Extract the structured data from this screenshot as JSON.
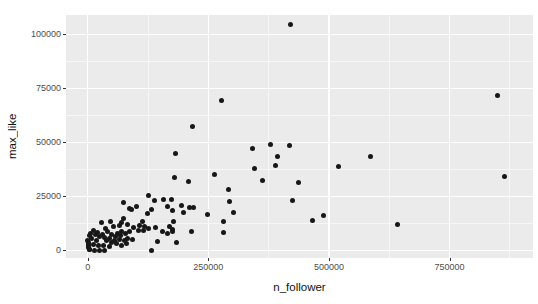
{
  "chart_data": {
    "type": "scatter",
    "title": "",
    "xlabel": "n_follower",
    "ylabel": "max_like",
    "legend": "none",
    "grid": true,
    "panel_bg": "#EBEBEB",
    "grid_major_color": "#FFFFFF",
    "grid_minor_color": "rgba(255,255,255,0.55)",
    "point_color": "#171717",
    "tick_color": "#333333",
    "tick_label_color": "#4D4D4D",
    "axis_title_color": "#111111",
    "xlim": [
      -45000,
      923000
    ],
    "ylim": [
      -3500,
      109000
    ],
    "x_ticks": [
      {
        "label": "0",
        "value": 0
      },
      {
        "label": "250000",
        "value": 250000
      },
      {
        "label": "500000",
        "value": 500000
      },
      {
        "label": "750000",
        "value": 750000
      }
    ],
    "y_ticks": [
      {
        "label": "0",
        "value": 0
      },
      {
        "label": "25000",
        "value": 25000
      },
      {
        "label": "50000",
        "value": 50000
      },
      {
        "label": "75000",
        "value": 75000
      },
      {
        "label": "100000",
        "value": 100000
      }
    ],
    "x_minor": [
      125000,
      375000,
      625000,
      875000
    ],
    "y_minor": [
      12500,
      37500,
      62500,
      87500
    ],
    "points": [
      [
        421200,
        104400
      ],
      [
        278000,
        69500
      ],
      [
        217800,
        57500
      ],
      [
        341300,
        47000
      ],
      [
        379100,
        49000
      ],
      [
        417600,
        48700
      ],
      [
        848500,
        71800
      ],
      [
        863100,
        34300
      ],
      [
        392700,
        43600
      ],
      [
        389400,
        39200
      ],
      [
        436300,
        31500
      ],
      [
        423900,
        23300
      ],
      [
        465300,
        13900
      ],
      [
        489600,
        16100
      ],
      [
        586400,
        43600
      ],
      [
        519300,
        38800
      ],
      [
        641700,
        12200
      ],
      [
        345000,
        38000
      ],
      [
        179000,
        33700
      ],
      [
        208100,
        32100
      ],
      [
        262000,
        35200
      ],
      [
        362400,
        32600
      ],
      [
        291100,
        28400
      ],
      [
        173600,
        23800
      ],
      [
        194400,
        21000
      ],
      [
        211600,
        19800
      ],
      [
        293100,
        22600
      ],
      [
        181500,
        45000
      ],
      [
        126600,
        25600
      ],
      [
        137500,
        23000
      ],
      [
        157700,
        23800
      ],
      [
        73200,
        22200
      ],
      [
        87100,
        19500
      ],
      [
        175300,
        18300
      ],
      [
        89800,
        18900
      ],
      [
        100200,
        20200
      ],
      [
        131300,
        19100
      ],
      [
        124500,
        17300
      ],
      [
        166000,
        20200
      ],
      [
        74700,
        15000
      ],
      [
        69100,
        13000
      ],
      [
        81500,
        11900
      ],
      [
        114100,
        13400
      ],
      [
        117600,
        11100
      ],
      [
        105200,
        9300
      ],
      [
        70500,
        8800
      ],
      [
        62200,
        7700
      ],
      [
        83000,
        5700
      ],
      [
        93400,
        5000
      ],
      [
        155600,
        8800
      ],
      [
        166000,
        7700
      ],
      [
        174900,
        8800
      ],
      [
        143800,
        4200
      ],
      [
        183200,
        3700
      ],
      [
        131300,
        200
      ],
      [
        218400,
        19900
      ],
      [
        197700,
        17600
      ],
      [
        247500,
        16700
      ],
      [
        280700,
        13600
      ],
      [
        301400,
        17600
      ],
      [
        178400,
        13300
      ],
      [
        175700,
        9900
      ],
      [
        170100,
        11000
      ],
      [
        215100,
        8900
      ],
      [
        282100,
        8300
      ],
      [
        28400,
        13000
      ],
      [
        47100,
        13300
      ],
      [
        52500,
        11000
      ],
      [
        37300,
        10200
      ],
      [
        64900,
        11400
      ],
      [
        95400,
        10500
      ],
      [
        107900,
        11400
      ],
      [
        87100,
        8700
      ],
      [
        116200,
        9400
      ],
      [
        125100,
        10200
      ],
      [
        141100,
        10500
      ],
      [
        5600,
        7900
      ],
      [
        16600,
        7400
      ],
      [
        24900,
        6300
      ],
      [
        35300,
        5900
      ],
      [
        45600,
        5600
      ],
      [
        56000,
        4800
      ],
      [
        66400,
        5200
      ],
      [
        76800,
        4800
      ],
      [
        600,
        4800
      ],
      [
        2000,
        3200
      ],
      [
        1200,
        2500
      ],
      [
        11000,
        2800
      ],
      [
        21400,
        2200
      ],
      [
        31700,
        2200
      ],
      [
        44200,
        1700
      ],
      [
        1000,
        1200
      ],
      [
        3000,
        600
      ],
      [
        4100,
        300
      ],
      [
        14500,
        100
      ],
      [
        24900,
        50
      ],
      [
        35300,
        200
      ],
      [
        900,
        2300
      ],
      [
        1500,
        3900
      ],
      [
        8300,
        5300
      ],
      [
        18700,
        4400
      ],
      [
        20700,
        8300
      ],
      [
        31100,
        7600
      ],
      [
        41500,
        8600
      ],
      [
        49800,
        7200
      ],
      [
        58100,
        6500
      ],
      [
        68500,
        7000
      ],
      [
        78800,
        7900
      ],
      [
        12400,
        9300
      ],
      [
        4100,
        6700
      ],
      [
        39400,
        4400
      ],
      [
        49800,
        3700
      ],
      [
        60200,
        3000
      ],
      [
        70500,
        2500
      ],
      [
        80900,
        3200
      ]
    ]
  }
}
